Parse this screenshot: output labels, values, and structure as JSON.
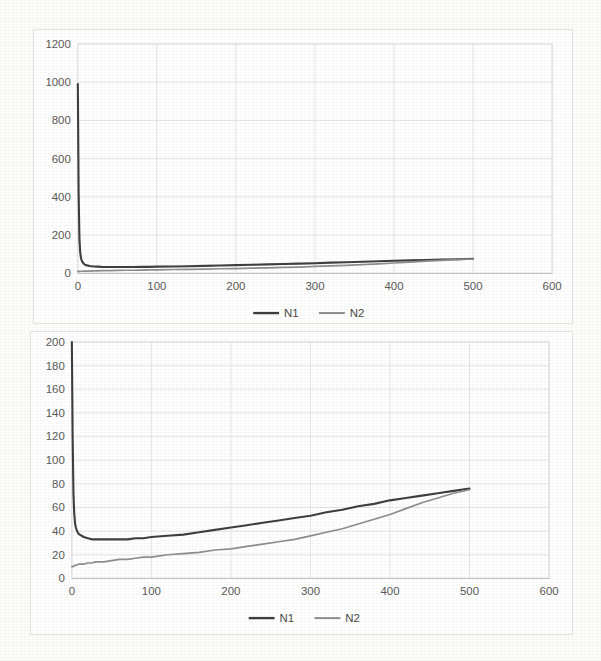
{
  "document": {
    "background_color": "#fdfdfc",
    "page_width": 601,
    "page_height": 661
  },
  "colors": {
    "series_n1": "#3f3f3f",
    "series_n2": "#8e8e8e",
    "gridline": "#d9d9e0",
    "axis": "#bdbdbd",
    "tick_text": "#5a5a58",
    "frame": "#dcdcdc"
  },
  "charts": [
    {
      "id": "chart-top",
      "name": "top-chart",
      "legend_position": "bottom",
      "legend": [
        {
          "key": "n1",
          "label": "N1"
        },
        {
          "key": "n2",
          "label": "N2"
        }
      ],
      "x_ticks": [
        "0",
        "100",
        "200",
        "300",
        "400",
        "500",
        "600"
      ],
      "y_ticks": [
        "0",
        "200",
        "400",
        "600",
        "800",
        "1000",
        "1200"
      ]
    },
    {
      "id": "chart-bottom",
      "name": "bottom-chart",
      "legend_position": "bottom",
      "legend": [
        {
          "key": "n1",
          "label": "N1"
        },
        {
          "key": "n2",
          "label": "N2"
        }
      ],
      "x_ticks": [
        "0",
        "100",
        "200",
        "300",
        "400",
        "500",
        "600"
      ],
      "y_ticks": [
        "0",
        "20",
        "40",
        "60",
        "80",
        "100",
        "120",
        "140",
        "160",
        "180",
        "200"
      ]
    }
  ],
  "chart_data": [
    {
      "type": "line",
      "title": "",
      "xlabel": "",
      "ylabel": "",
      "xlim": [
        0,
        600
      ],
      "ylim": [
        0,
        1200
      ],
      "xticks": [
        0,
        100,
        200,
        300,
        400,
        500,
        600
      ],
      "yticks": [
        0,
        200,
        400,
        600,
        800,
        1000,
        1200
      ],
      "grid": true,
      "legend": [
        "N1",
        "N2"
      ],
      "legend_position": "bottom",
      "x": [
        0,
        1,
        2,
        3,
        4,
        5,
        6,
        8,
        10,
        15,
        20,
        25,
        30,
        40,
        50,
        60,
        70,
        80,
        90,
        100,
        120,
        140,
        160,
        180,
        200,
        220,
        240,
        260,
        280,
        300,
        320,
        340,
        360,
        380,
        400,
        420,
        440,
        460,
        480,
        500
      ],
      "series": [
        {
          "name": "N1",
          "values": [
            990,
            420,
            180,
            110,
            80,
            66,
            58,
            48,
            43,
            38,
            36,
            35,
            34,
            33,
            33,
            33,
            33,
            34,
            34,
            35,
            36,
            37,
            39,
            41,
            43,
            45,
            47,
            49,
            51,
            53,
            56,
            58,
            61,
            63,
            66,
            68,
            70,
            72,
            74,
            76
          ]
        },
        {
          "name": "N2",
          "values": [
            10,
            10,
            10,
            11,
            11,
            11,
            11,
            12,
            12,
            12,
            13,
            13,
            14,
            14,
            15,
            16,
            16,
            17,
            18,
            18,
            20,
            21,
            22,
            24,
            25,
            27,
            29,
            31,
            33,
            36,
            39,
            42,
            46,
            50,
            54,
            59,
            64,
            68,
            72,
            75
          ]
        }
      ]
    },
    {
      "type": "line",
      "title": "",
      "xlabel": "",
      "ylabel": "",
      "xlim": [
        0,
        600
      ],
      "ylim": [
        0,
        200
      ],
      "xticks": [
        0,
        100,
        200,
        300,
        400,
        500,
        600
      ],
      "yticks": [
        0,
        20,
        40,
        60,
        80,
        100,
        120,
        140,
        160,
        180,
        200
      ],
      "grid": true,
      "legend": [
        "N1",
        "N2"
      ],
      "legend_position": "bottom",
      "x": [
        0,
        1,
        2,
        3,
        4,
        5,
        6,
        8,
        10,
        15,
        20,
        25,
        30,
        40,
        50,
        60,
        70,
        80,
        90,
        100,
        120,
        140,
        160,
        180,
        200,
        220,
        240,
        260,
        280,
        300,
        320,
        340,
        360,
        380,
        400,
        420,
        440,
        460,
        480,
        500
      ],
      "series": [
        {
          "name": "N1",
          "values": [
            200,
            120,
            72,
            55,
            47,
            43,
            41,
            38,
            37,
            35,
            34,
            33,
            33,
            33,
            33,
            33,
            33,
            34,
            34,
            35,
            36,
            37,
            39,
            41,
            43,
            45,
            47,
            49,
            51,
            53,
            56,
            58,
            61,
            63,
            66,
            68,
            70,
            72,
            74,
            76
          ]
        },
        {
          "name": "N2",
          "values": [
            10,
            10,
            10,
            11,
            11,
            11,
            11,
            12,
            12,
            12,
            13,
            13,
            14,
            14,
            15,
            16,
            16,
            17,
            18,
            18,
            20,
            21,
            22,
            24,
            25,
            27,
            29,
            31,
            33,
            36,
            39,
            42,
            46,
            50,
            54,
            59,
            64,
            68,
            72,
            75
          ]
        }
      ]
    }
  ]
}
